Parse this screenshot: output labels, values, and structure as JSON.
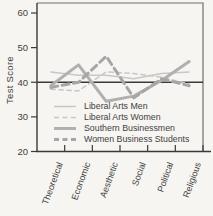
{
  "figure_background": "#f6f5f2",
  "chart_data": {
    "type": "line",
    "title": "",
    "ylabel": "Test Score",
    "xlabel": "",
    "ylim": [
      20,
      60
    ],
    "yticks": [
      60,
      50,
      40,
      30,
      20
    ],
    "reference_line_y": 40,
    "grid": false,
    "legend_position": "inside-bottom-left",
    "categories": [
      "Theoretical",
      "Economic",
      "Aesthetic",
      "Social",
      "Political",
      "Religious"
    ],
    "series": [
      {
        "name": "Liberal Arts Men",
        "style": "thin-solid",
        "values": [
          43,
          42,
          42,
          41,
          42.5,
          43
        ]
      },
      {
        "name": "Liberal Arts Women",
        "style": "thin-dashed",
        "values": [
          38,
          37.5,
          43,
          42.5,
          41.5,
          39.5
        ]
      },
      {
        "name": "Southern Businessmen",
        "style": "thick-solid",
        "values": [
          39,
          45,
          34.5,
          36,
          40.5,
          46
        ]
      },
      {
        "name": "Women Business Students",
        "style": "thick-dashed",
        "values": [
          38.5,
          40,
          47.5,
          35.5,
          41,
          39
        ]
      }
    ],
    "colors": {
      "thin_line": "#c7c7c7",
      "thick_solid_line": "#b0b0b0",
      "thick_dashed_line": "#a6a6a6",
      "axis": "#3a3a3a",
      "frame": "#707070",
      "reference_line": "#3a3a3a",
      "text": "#3f3f3f",
      "background": "#f6f5f2"
    }
  }
}
